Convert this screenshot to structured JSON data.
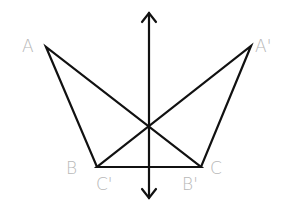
{
  "diagram": {
    "type": "reflection",
    "colors": {
      "line": "#111111",
      "label": "#b8b8b8",
      "background": "#ffffff"
    },
    "axis": {
      "x": 149,
      "y1": 12,
      "y2": 199,
      "arrows": "both"
    },
    "points": {
      "A": {
        "x": 46,
        "y": 47
      },
      "A_prime": {
        "x": 251,
        "y": 46
      },
      "B": {
        "x": 97,
        "y": 167
      },
      "C": {
        "x": 201,
        "y": 167
      },
      "B_prime": {
        "x": 201,
        "y": 167
      },
      "C_prime": {
        "x": 97,
        "y": 167
      }
    },
    "labels": {
      "A": "A",
      "A_prime": "A'",
      "B": "B",
      "C": "C",
      "B_prime": "B'",
      "C_prime": "C'"
    },
    "triangles": [
      {
        "name": "ABC",
        "vertices": [
          "A",
          "B",
          "C"
        ]
      },
      {
        "name": "A'B'C'",
        "vertices": [
          "A'",
          "B'",
          "C'"
        ]
      }
    ]
  }
}
